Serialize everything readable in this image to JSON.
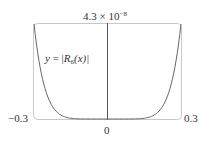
{
  "chart_data": {
    "type": "line",
    "title": "",
    "xlabel": "",
    "ylabel": "",
    "xlim": [
      -0.3,
      0.3
    ],
    "ylim": [
      0,
      4.3e-08
    ],
    "x_tick_labels": [
      "-0.3",
      "0",
      "0.3"
    ],
    "y_tick_labels": [
      "4.3 × 10^-8"
    ],
    "grid": false,
    "legend": null,
    "annotations": [
      "y = |R6(x)|"
    ],
    "series": [
      {
        "name": "y = |R6(x)|",
        "x": [
          -0.3,
          -0.27,
          -0.24,
          -0.21,
          -0.18,
          -0.15,
          -0.12,
          -0.09,
          -0.06,
          -0.03,
          0,
          0.03,
          0.06,
          0.09,
          0.12,
          0.15,
          0.18,
          0.21,
          0.24,
          0.27,
          0.3
        ],
        "values": [
          4.3e-08,
          2.19e-08,
          1.13e-08,
          5.9e-09,
          2.9e-09,
          1.3e-09,
          5.5e-10,
          1.8e-10,
          4e-11,
          4e-12,
          0,
          4e-12,
          4e-11,
          1.8e-10,
          5.5e-10,
          1.3e-09,
          2.9e-09,
          5.9e-09,
          1.13e-08,
          2.19e-08,
          4.3e-08
        ]
      }
    ]
  },
  "labels": {
    "y_top_mantissa": "4.3 × 10",
    "y_top_exponent": "−8",
    "curve_y": "y",
    "curve_eq": " = |",
    "curve_R": "R",
    "curve_sub": "6",
    "curve_arg": "(x)|",
    "x_left": "−0.3",
    "x_right": "0.3",
    "x_zero": "0"
  },
  "colors": {
    "frame": "#c8c8c8",
    "axis": "#555555",
    "curve": "#666666"
  }
}
